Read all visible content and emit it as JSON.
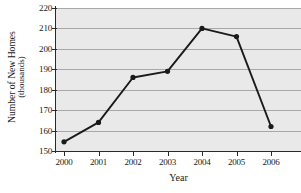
{
  "chart_data": {
    "type": "line",
    "title": "",
    "xlabel": "Year",
    "ylabel": "Number of New Homes (thousands)",
    "ylabel_line1": "Number of New Homes",
    "ylabel_line2": "(thousands)",
    "categories": [
      "2000",
      "2001",
      "2002",
      "2003",
      "2004",
      "2005",
      "2006"
    ],
    "values": [
      154.5,
      164,
      186,
      189,
      210,
      206,
      162
    ],
    "x": [
      2000,
      2001,
      2002,
      2003,
      2004,
      2005,
      2006
    ],
    "ylim": [
      150,
      220
    ],
    "yticks": [
      150,
      160,
      170,
      180,
      190,
      200,
      210,
      220
    ],
    "ytick_labels": [
      "150",
      "160",
      "170",
      "180",
      "190",
      "200",
      "210",
      "220"
    ],
    "xtick_labels": [
      "2000",
      "2001",
      "2002",
      "2003",
      "2004",
      "2005",
      "2006"
    ],
    "grid": true,
    "legend": false,
    "legend_position": "none",
    "marker": "filled-circle",
    "colors": {
      "line": "#1a1a1a",
      "marker": "#1a1a1a",
      "plot_background": "#e9e9e9",
      "gridline": "#a8a8a8",
      "axis": "#2a2a2a",
      "page_background": "#ffffff",
      "text": "#1a1a1a"
    }
  }
}
